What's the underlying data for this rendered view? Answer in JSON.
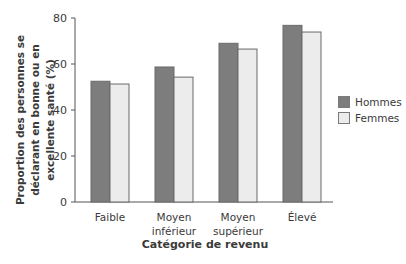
{
  "chart_data": {
    "type": "bar",
    "title": "",
    "xlabel": "Catégorie de revenu",
    "ylabel": "Proportion des personnes se déclarant en bonne ou en excellente santé (%)",
    "ylabel_lines": [
      "Proportion des personnes se",
      "déclarant en bonne ou en",
      "excellente santé (%)"
    ],
    "categories": [
      "Faible",
      "Moyen inférieur",
      "Moyen supérieur",
      "Élevé"
    ],
    "category_lines": [
      [
        "Faible"
      ],
      [
        "Moyen",
        "inférieur"
      ],
      [
        "Moyen",
        "supérieur"
      ],
      [
        "Élevé"
      ]
    ],
    "series": [
      {
        "name": "Hommes",
        "values": [
          52.5,
          58.7,
          69.0,
          76.8
        ],
        "color": "#7d7d7d"
      },
      {
        "name": "Femmes",
        "values": [
          51.3,
          54.3,
          66.5,
          73.9
        ],
        "color": "#ececec"
      }
    ],
    "ylim": [
      0,
      80
    ],
    "yticks": [
      0,
      20,
      40,
      60,
      80
    ],
    "grid": false,
    "legend_position": "right"
  },
  "legend": {
    "items": [
      {
        "label": "Hommes",
        "color": "#7d7d7d"
      },
      {
        "label": "Femmes",
        "color": "#ececec"
      }
    ]
  }
}
